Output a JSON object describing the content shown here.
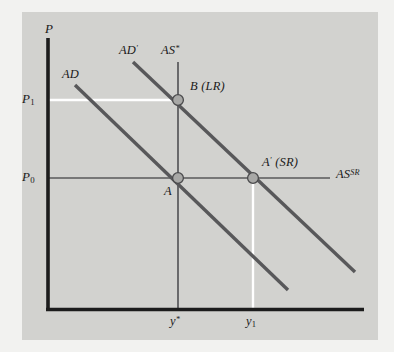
{
  "figure": {
    "type": "economics-ad-as-diagram",
    "title": "",
    "axes": {
      "y_axis_label": "P",
      "x_axis_label": "",
      "origin_px": [
        47,
        310
      ]
    },
    "price_ticks": [
      {
        "id": "p1",
        "label_main": "P",
        "label_sub": "1",
        "y_px": 100
      },
      {
        "id": "p0",
        "label_main": "P",
        "label_sub": "0",
        "y_px": 178
      }
    ],
    "output_ticks": [
      {
        "id": "ystar",
        "label_main": "y",
        "label_sup": "*",
        "x_px": 178
      },
      {
        "id": "y1",
        "label_main": "y",
        "label_sub": "1",
        "x_px": 253
      }
    ],
    "curves": [
      {
        "id": "ad",
        "label_main": "AD",
        "label_sup": "",
        "label_x": 62,
        "label_y": 70,
        "x1": 75,
        "y1": 85,
        "x2": 288,
        "y2": 290,
        "color": "#58585a",
        "width": 3.4
      },
      {
        "id": "ad-prime",
        "label_main": "AD",
        "label_sup": "′",
        "label_x": 120,
        "label_y": 46,
        "x1": 133,
        "y1": 62,
        "x2": 355,
        "y2": 272,
        "color": "#58585a",
        "width": 3.4
      },
      {
        "id": "as-star",
        "label_main": "AS",
        "label_sup": "*",
        "label_x": 163,
        "label_y": 46,
        "x1": 178,
        "y1": 62,
        "x2": 178,
        "y2": 310,
        "color": "#58585a",
        "width": 1.6
      },
      {
        "id": "as-sr",
        "label_main": "AS",
        "label_sup": "SR",
        "label_x": 335,
        "label_y": 170,
        "x1": 47,
        "y1": 178,
        "x2": 330,
        "y2": 178,
        "color": "#58585a",
        "width": 1.6
      }
    ],
    "points": [
      {
        "id": "a",
        "label_main": "A",
        "label_sup": "",
        "label_paren": "",
        "x_px": 178,
        "y_px": 178,
        "label_x": 166,
        "label_y": 186,
        "radius": 5.4
      },
      {
        "id": "b",
        "label_main": "B",
        "label_sup": "",
        "label_paren": "(LR)",
        "x_px": 178,
        "y_px": 100,
        "label_x": 190,
        "label_y": 82,
        "radius": 5.4
      },
      {
        "id": "a-prime",
        "label_main": "A",
        "label_sup": "′",
        "label_paren": "(SR)",
        "x_px": 253,
        "y_px": 178,
        "label_x": 263,
        "label_y": 158,
        "radius": 5.4
      }
    ],
    "guide_lines": [
      {
        "id": "p1-to-b",
        "x1": 47,
        "y1": 100,
        "x2": 178,
        "y2": 100
      },
      {
        "id": "a-prime-to-y1",
        "x1": 253,
        "y1": 178,
        "x2": 253,
        "y2": 310
      }
    ],
    "colors": {
      "panel_background": "#d2d2cf",
      "page_background": "#f2f2f0",
      "axis": "#1c1c1c",
      "curve": "#58585a",
      "point_fill": "#a8a8a6",
      "point_stroke": "#4a4a4c",
      "guide": "#ffffff",
      "text": "#1a1a1a"
    }
  }
}
